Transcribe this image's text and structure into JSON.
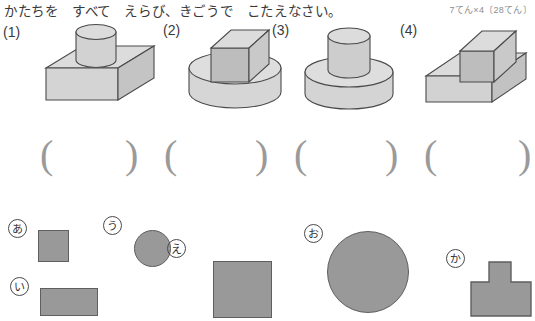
{
  "header": {
    "prompt": "かたちを　すべて　えらび、きごうで　こたえなさい。",
    "score": "7てん×4〔28てん〕"
  },
  "problems": [
    {
      "number": "(1)",
      "solid": "cylinder-on-box",
      "answer": ""
    },
    {
      "number": "(2)",
      "solid": "box-on-cylinder",
      "answer": ""
    },
    {
      "number": "(3)",
      "solid": "cylinder-on-cylinder",
      "answer": ""
    },
    {
      "number": "(4)",
      "solid": "box-on-box",
      "answer": ""
    }
  ],
  "answer_brackets": {
    "open": "(",
    "close": ")"
  },
  "choices": [
    {
      "label": "あ",
      "shape": "square",
      "note": "small square"
    },
    {
      "label": "い",
      "shape": "rectangle",
      "note": "wide rectangle"
    },
    {
      "label": "う",
      "shape": "circle",
      "note": "small circle"
    },
    {
      "label": "え",
      "shape": "square",
      "note": "large square"
    },
    {
      "label": "お",
      "shape": "circle",
      "note": "large circle"
    },
    {
      "label": "か",
      "shape": "tee",
      "note": "t-shape"
    }
  ],
  "colors": {
    "flat_fill": "#999999",
    "flat_stroke": "#5f5f5f",
    "solid_top": "#dcdcdc",
    "solid_front": "#d2d2d2",
    "solid_side": "#c3c3c3",
    "solid_stroke": "#4a4a4a",
    "paren": "#9a9a9a",
    "text": "#3a3a3a",
    "score_text": "#8d8d8d"
  }
}
